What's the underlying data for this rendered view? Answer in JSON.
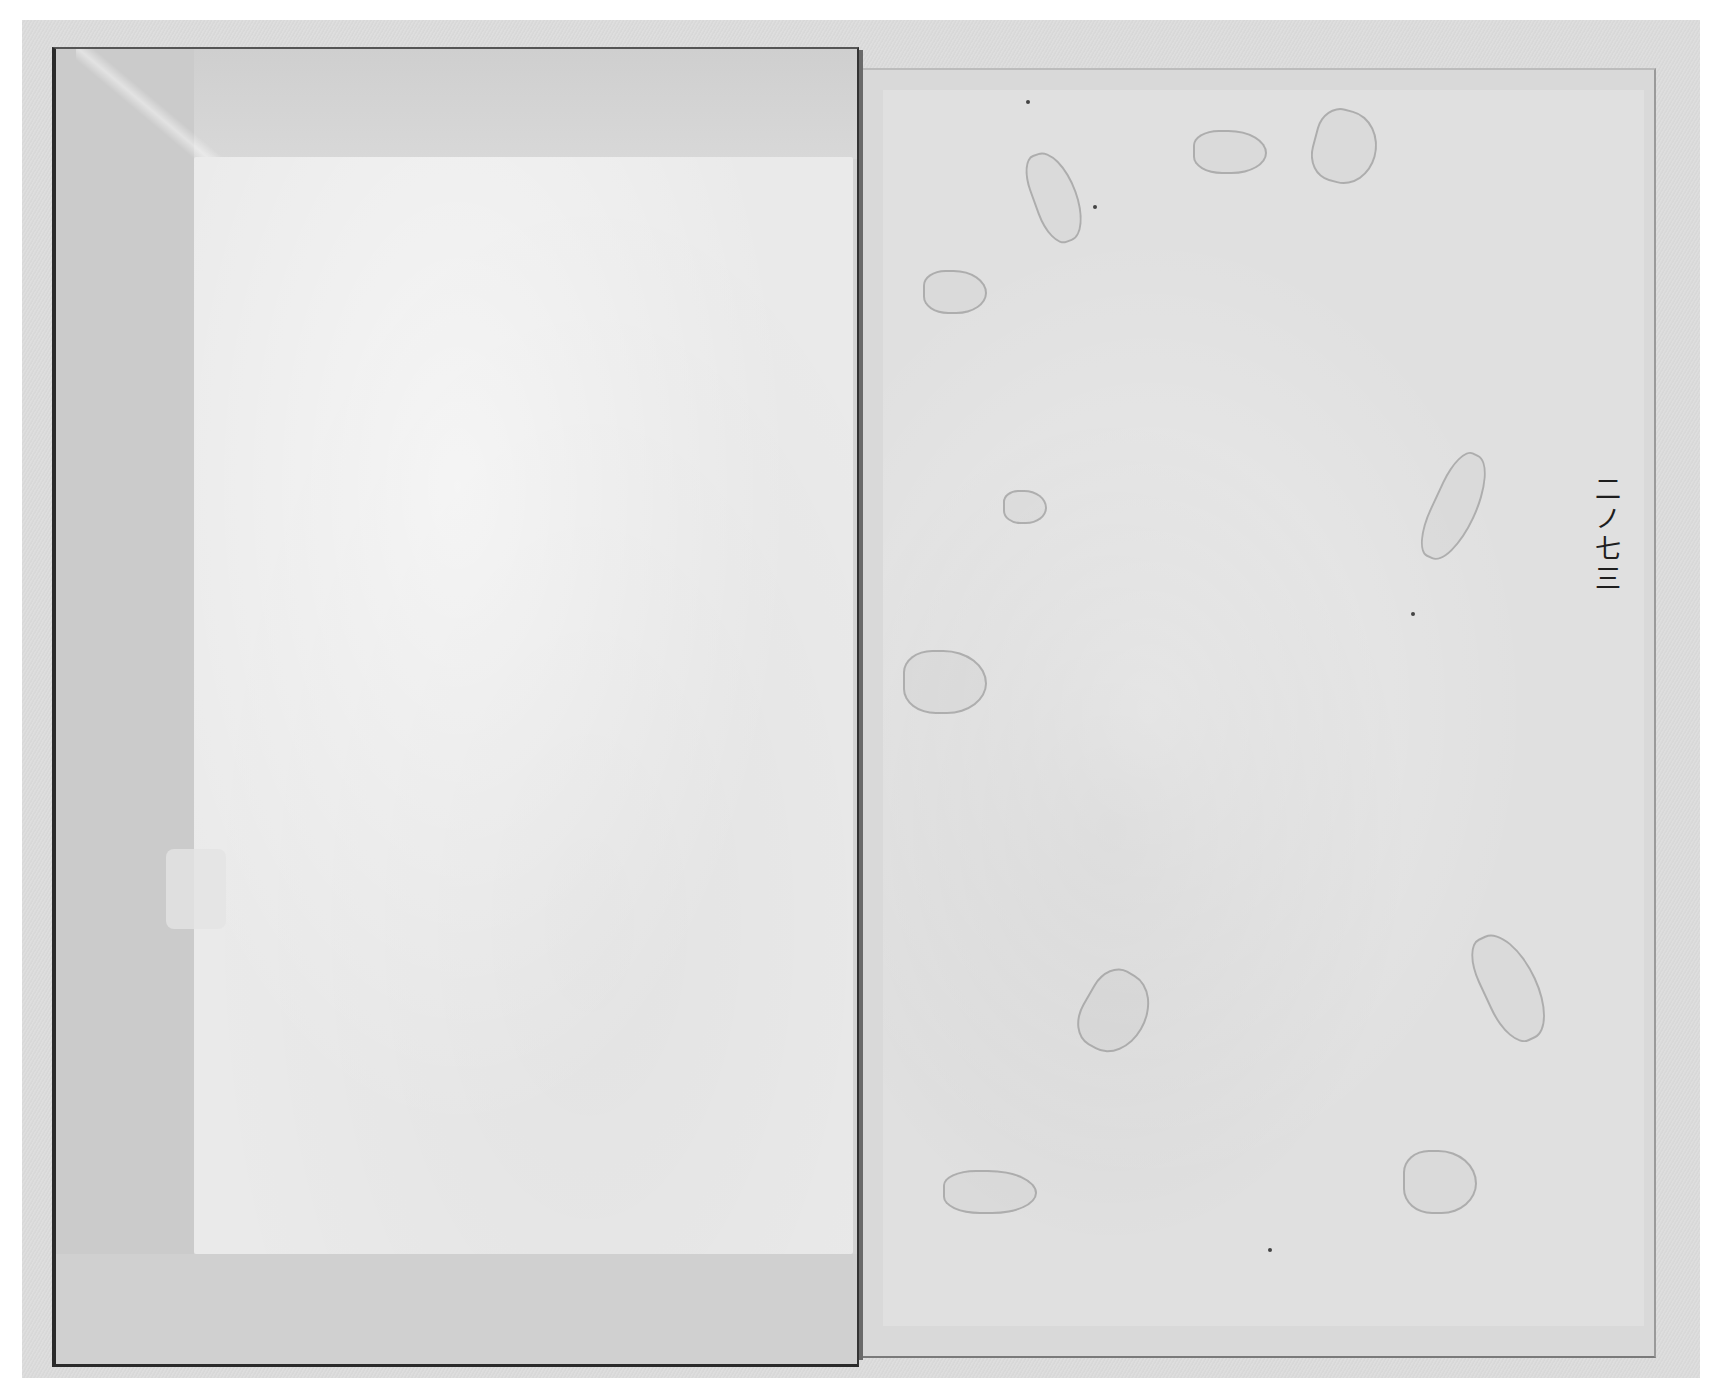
{
  "document": {
    "type": "scanned-book-spread",
    "left_page": {
      "content": "",
      "description": "blank cover/endpaper with folded border"
    },
    "right_page": {
      "content": "",
      "page_marking": "二ノ七三"
    }
  },
  "colors": {
    "background": "#ffffff",
    "scan_bed": "#dcdcdc",
    "left_page_fold": "#d3d3d3",
    "left_page_inner": "#eaeaea",
    "right_page": "#d9d9d9",
    "ink": "#1e1e1e"
  }
}
